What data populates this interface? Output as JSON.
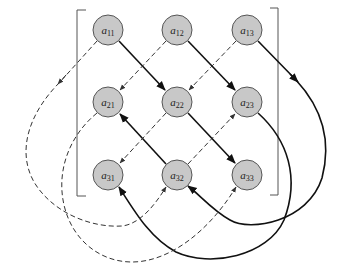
{
  "diagram": {
    "type": "3x3 matrix determinant (rule of Sarrus) diagram",
    "colors": {
      "node_fill": "#c8c8c8",
      "node_stroke": "#555555",
      "solid_arrow": "#111111",
      "dashed_arrow": "#333333",
      "bracket": "#555555",
      "background": "#ffffff"
    },
    "nodes": [
      {
        "id": "a11",
        "base": "a",
        "sub": "11"
      },
      {
        "id": "a12",
        "base": "a",
        "sub": "12"
      },
      {
        "id": "a13",
        "base": "a",
        "sub": "13"
      },
      {
        "id": "a21",
        "base": "a",
        "sub": "21"
      },
      {
        "id": "a22",
        "base": "a",
        "sub": "22"
      },
      {
        "id": "a23",
        "base": "a",
        "sub": "23"
      },
      {
        "id": "a31",
        "base": "a",
        "sub": "31"
      },
      {
        "id": "a32",
        "base": "a",
        "sub": "32"
      },
      {
        "id": "a33",
        "base": "a",
        "sub": "33"
      }
    ],
    "edges": {
      "solid": [
        [
          "a11",
          "a22"
        ],
        [
          "a22",
          "a33"
        ],
        [
          "a12",
          "a23"
        ],
        [
          "a23",
          "a31"
        ],
        [
          "a13",
          "a32"
        ],
        [
          "a32",
          "a21"
        ]
      ],
      "dashed": [
        [
          "a13",
          "a22"
        ],
        [
          "a22",
          "a31"
        ],
        [
          "a12",
          "a21"
        ],
        [
          "a21",
          "a33"
        ],
        [
          "a11",
          "a32"
        ],
        [
          "a32",
          "a23"
        ]
      ]
    }
  }
}
